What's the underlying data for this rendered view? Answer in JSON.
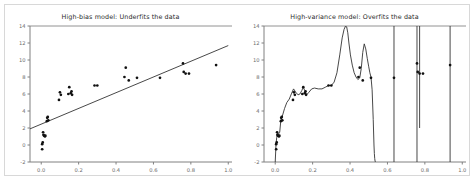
{
  "figure": {
    "width": 475,
    "height": 183,
    "background_color": "#ffffff",
    "border_color": "#d8d8d8",
    "axis_color": "#808080",
    "tick_label_color": "#6a6a6a",
    "title_color": "#2a2a2a",
    "data_color": "#111111",
    "curve_color": "#333333"
  },
  "chart_data": [
    {
      "panel": "left",
      "type": "scatter",
      "title": "High-bias model: Underfits the data",
      "xlabel": "",
      "ylabel": "",
      "xlim": [
        -0.06,
        1.02
      ],
      "ylim": [
        -2.0,
        14.0
      ],
      "xticks": [
        0.0,
        0.2,
        0.4,
        0.6,
        0.8,
        1.0
      ],
      "xticklabels": [
        "0.0",
        "0.2",
        "0.4",
        "0.6",
        "0.8",
        "1.0"
      ],
      "yticks": [
        -2,
        0,
        2,
        4,
        6,
        8,
        10,
        12,
        14
      ],
      "yticklabels": [
        "-2",
        "0",
        "2",
        "4",
        "6",
        "8",
        "10",
        "12",
        "14"
      ],
      "grid": false,
      "legend": "none",
      "scatter": {
        "name": "samples",
        "marker": "filled-circle",
        "color": "#111111",
        "x": [
          0.005,
          0.005,
          0.008,
          0.01,
          0.012,
          0.015,
          0.02,
          0.022,
          0.03,
          0.032,
          0.035,
          0.038,
          0.095,
          0.1,
          0.105,
          0.145,
          0.15,
          0.158,
          0.162,
          0.165,
          0.285,
          0.3,
          0.445,
          0.452,
          0.468,
          0.512,
          0.635,
          0.758,
          0.762,
          0.772,
          0.79,
          0.935
        ],
        "y": [
          -0.5,
          0.1,
          0.3,
          1.5,
          1.2,
          1.1,
          1.0,
          1.1,
          2.8,
          3.2,
          3.3,
          2.9,
          5.3,
          6.2,
          5.9,
          6.0,
          6.8,
          6.1,
          6.3,
          5.9,
          7.0,
          7.0,
          8.0,
          9.1,
          7.6,
          7.9,
          7.9,
          9.6,
          8.6,
          8.4,
          8.4,
          9.4
        ]
      },
      "fit_line": {
        "name": "linear fit",
        "type": "line",
        "color": "#333333",
        "x": [
          -0.06,
          1.0
        ],
        "y": [
          1.9,
          11.7
        ]
      },
      "annotations": []
    },
    {
      "panel": "right",
      "type": "line",
      "title": "High-variance model: Overfits the data",
      "xlabel": "",
      "ylabel": "",
      "xlim": [
        -0.06,
        1.02
      ],
      "ylim": [
        -2.0,
        14.0
      ],
      "xticks": [
        0.0,
        0.2,
        0.4,
        0.6,
        0.8,
        1.0
      ],
      "xticklabels": [
        "0.0",
        "0.2",
        "0.4",
        "0.6",
        "0.8",
        "1.0"
      ],
      "yticks": [
        -2,
        0,
        2,
        4,
        6,
        8,
        10,
        12,
        14
      ],
      "yticklabels": [
        "-2",
        "0",
        "2",
        "4",
        "6",
        "8",
        "10",
        "12",
        "14"
      ],
      "grid": false,
      "legend": "none",
      "scatter": {
        "name": "samples",
        "marker": "filled-circle",
        "color": "#111111",
        "x": [
          0.005,
          0.005,
          0.008,
          0.01,
          0.012,
          0.015,
          0.02,
          0.022,
          0.03,
          0.032,
          0.035,
          0.038,
          0.095,
          0.1,
          0.105,
          0.145,
          0.15,
          0.158,
          0.162,
          0.165,
          0.285,
          0.3,
          0.445,
          0.452,
          0.468,
          0.512,
          0.635,
          0.758,
          0.762,
          0.772,
          0.79,
          0.935
        ],
        "y": [
          -0.5,
          0.1,
          0.3,
          1.5,
          1.2,
          1.1,
          1.0,
          1.1,
          2.8,
          3.2,
          3.3,
          2.9,
          5.3,
          6.2,
          5.9,
          6.0,
          6.8,
          6.1,
          6.3,
          5.9,
          7.0,
          7.0,
          8.0,
          9.1,
          7.6,
          7.9,
          7.9,
          9.6,
          8.6,
          8.4,
          8.4,
          9.4
        ]
      },
      "fit_curve": {
        "name": "high-degree polynomial fit",
        "type": "line",
        "color": "#333333",
        "description": "Wildly oscillating interpolant that passes near every point, with near-vertical asymptotic spikes between sparse points",
        "x": [
          0.0,
          0.004,
          0.008,
          0.012,
          0.018,
          0.024,
          0.03,
          0.038,
          0.05,
          0.062,
          0.075,
          0.088,
          0.098,
          0.11,
          0.122,
          0.132,
          0.142,
          0.15,
          0.158,
          0.168,
          0.18,
          0.195,
          0.21,
          0.23,
          0.25,
          0.268,
          0.285,
          0.3,
          0.315,
          0.33,
          0.345,
          0.358,
          0.368,
          0.376,
          0.382,
          0.388,
          0.394,
          0.402,
          0.412,
          0.422,
          0.432,
          0.442,
          0.452,
          0.46,
          0.468,
          0.476,
          0.484,
          0.492,
          0.5,
          0.506,
          0.512,
          0.518,
          0.524,
          0.528,
          0.53,
          0.532,
          0.534,
          0.536
        ],
        "y": [
          -2.0,
          0.0,
          0.9,
          1.4,
          1.3,
          1.5,
          2.9,
          3.4,
          4.3,
          5.0,
          5.4,
          6.1,
          6.6,
          6.2,
          5.9,
          6.0,
          6.4,
          6.8,
          6.4,
          5.9,
          6.2,
          6.6,
          6.7,
          6.6,
          6.6,
          6.8,
          7.0,
          7.0,
          7.4,
          8.5,
          10.6,
          12.6,
          13.6,
          14.0,
          13.9,
          13.2,
          12.0,
          10.6,
          9.4,
          8.5,
          8.0,
          7.7,
          7.9,
          9.0,
          10.9,
          11.9,
          11.3,
          10.2,
          9.2,
          8.5,
          8.0,
          6.5,
          3.0,
          0.0,
          -1.0,
          -1.6,
          -1.9,
          -2.0
        ]
      },
      "spikes": {
        "name": "asymptote-like vertical excursions",
        "color": "#333333",
        "lines": [
          {
            "x": 0.635,
            "y_bottom": -2.0,
            "y_top": 14.0
          },
          {
            "x": 0.758,
            "y_bottom": -2.0,
            "y_top": 14.0
          },
          {
            "x": 0.772,
            "y_bottom": 2.0,
            "y_top": 14.0
          },
          {
            "x": 0.935,
            "y_bottom": -2.0,
            "y_top": 14.0
          }
        ]
      },
      "annotations": []
    }
  ]
}
